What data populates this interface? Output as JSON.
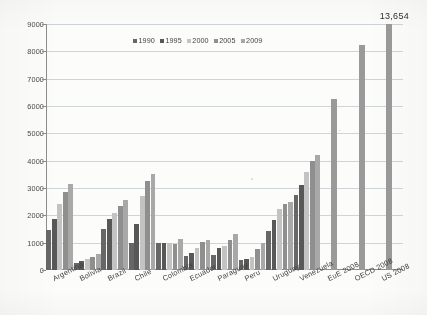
{
  "chart_data": {
    "type": "bar",
    "title": "",
    "subtitle": "",
    "xlabel": "",
    "ylabel": "",
    "ylim": [
      0,
      9000
    ],
    "ytick_step": 1000,
    "yticks": [
      "0",
      "1000",
      "2000",
      "3000",
      "4000",
      "5000",
      "6000",
      "7000",
      "8000",
      "9000"
    ],
    "grid": true,
    "legend_position": "top-center",
    "legend": [
      "1990",
      "1995",
      "2000",
      "2005",
      "2009"
    ],
    "categories": [
      "Argentina",
      "Bolivia",
      "Brazil",
      "Chile",
      "Colombia",
      "Ecuador",
      "Paraguay",
      "Peru",
      "Uruguay",
      "Venezuela",
      "EuE 2008",
      "OECD 2008",
      "US 2008"
    ],
    "series": [
      {
        "name": "1990",
        "values": [
          1450,
          260,
          1510,
          1000,
          1000,
          520,
          560,
          360,
          1420,
          2740,
          null,
          null,
          null
        ]
      },
      {
        "name": "1995",
        "values": [
          1850,
          330,
          1850,
          1700,
          1000,
          640,
          810,
          420,
          1820,
          3110,
          null,
          null,
          null
        ]
      },
      {
        "name": "2000",
        "values": [
          2410,
          390,
          2080,
          2710,
          980,
          790,
          890,
          470,
          2220,
          3570,
          null,
          null,
          null
        ]
      },
      {
        "name": "2005",
        "values": [
          2840,
          470,
          2340,
          3260,
          940,
          1040,
          1090,
          760,
          2430,
          4000,
          null,
          null,
          null
        ]
      },
      {
        "name": "2009",
        "values": [
          3140,
          570,
          2550,
          3510,
          1130,
          1090,
          1310,
          1000,
          2490,
          4210,
          null,
          null,
          null
        ]
      }
    ],
    "reference_bars": [
      {
        "name": "EuE 2008",
        "value": 6250
      },
      {
        "name": "OECD 2008",
        "value": 8250
      },
      {
        "name": "US 2008",
        "value": 13654,
        "clipped": true
      }
    ],
    "annotations": [
      {
        "text": "13,654",
        "target": "US 2008",
        "position": "top-right"
      }
    ],
    "series_colors": [
      "#676767",
      "#585858",
      "#c3c3c3",
      "#8f8f8f",
      "#a8a8a8"
    ],
    "reference_bar_color": "#9a9a9a"
  },
  "axis": {
    "y_tick_labels": [
      "9000",
      "8000",
      "7000",
      "6000",
      "5000",
      "4000",
      "3000",
      "2000",
      "1000",
      "0"
    ]
  },
  "annotation": {
    "value_label": "13,654"
  },
  "colors": {
    "grid": "#cfd4d8",
    "axis": "#8d8d8d",
    "background": "#fcfcfb",
    "text": "#3f3f3f"
  }
}
